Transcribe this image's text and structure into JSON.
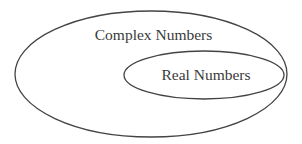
{
  "diagram": {
    "type": "venn-nested-sets",
    "sets": [
      {
        "id": "complex",
        "label": "Complex Numbers",
        "shape": "ellipse",
        "cx": 151,
        "cy": 74,
        "rx": 136,
        "ry": 63
      },
      {
        "id": "real",
        "label": "Real Numbers",
        "shape": "ellipse",
        "cx": 204,
        "cy": 75,
        "rx": 80,
        "ry": 24,
        "subset_of": "complex"
      }
    ],
    "stroke_color": "#444444",
    "background": "#ffffff"
  }
}
